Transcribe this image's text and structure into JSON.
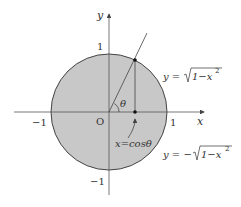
{
  "diagram": {
    "colors": {
      "fill": "#c8c8c8",
      "stroke": "#444444",
      "axis": "#555555",
      "text": "#333333",
      "background": "#ffffff"
    },
    "axes": {
      "x_label": "x",
      "y_label": "y",
      "origin_label": "O",
      "x_ticks": {
        "neg": "−1",
        "pos": "1"
      },
      "y_ticks": {
        "neg": "−1",
        "pos": "1"
      }
    },
    "angle_label": "θ",
    "annotation": "x=cosθ",
    "curves": {
      "upper": {
        "lhs": "y =",
        "rad": "1−x",
        "exp": "2"
      },
      "lower": {
        "lhs": "y = −",
        "rad": "1−x",
        "exp": "2"
      }
    }
  }
}
